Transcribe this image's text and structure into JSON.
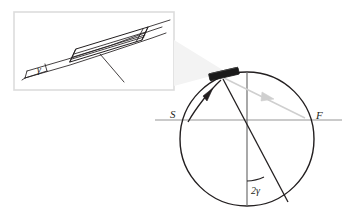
{
  "figure": {
    "background_color": "#ffffff",
    "ink_color": "#231f20",
    "gray_color": "#b9b9b9",
    "light_gray_color": "#cfcfcf",
    "mirror_fill": "#1a1a1a"
  },
  "inset": {
    "name": "mirror-detail-sketch",
    "border_color": "#d8d8d8",
    "x": 14,
    "y": 12,
    "width": 160,
    "height": 78,
    "angle_label": "γ",
    "angle_label_x": 37,
    "angle_label_y": 71,
    "description": "Hand-drawn sketch of a tilted mirror slab with rotation angle gamma measured from the horizontal beam direction"
  },
  "circle_diagram": {
    "name": "rotation-circle",
    "center_x": 247,
    "center_y": 139,
    "radius": 67,
    "stroke_color": "#231f20",
    "stroke_width": 1.3
  },
  "labels": {
    "source": "S",
    "source_x": 173,
    "source_y": 114,
    "focus": "F",
    "focus_x": 318,
    "focus_y": 116,
    "double_angle": "2γ",
    "double_angle_x": 253,
    "double_angle_y": 190,
    "inset_angle": "γ"
  },
  "elements": {
    "mirror": {
      "name": "mirror-bar",
      "center_x": 224,
      "center_y": 74,
      "length": 29,
      "thickness": 6,
      "rotation_deg": -12
    },
    "horizontal_axis": {
      "name": "optical-axis-line",
      "x1": 155,
      "y1": 120,
      "x2": 342,
      "y2": 120,
      "color": "#b9b9b9"
    },
    "vertical_diameter": {
      "name": "vertical-reference-diameter",
      "x1": 247,
      "y1": 72,
      "x2": 247,
      "y2": 206,
      "color": "#6f6f6f"
    },
    "incident_ray": {
      "name": "incident-ray-arrow",
      "from_x": 189,
      "from_y": 121,
      "to_x": 222,
      "to_y": 78,
      "color": "#231f20"
    },
    "reflected_ray": {
      "name": "reflected-ray-arrow",
      "from_x": 224,
      "from_y": 78,
      "to_x": 304,
      "to_y": 118,
      "color": "#cfcfcf"
    },
    "rotated_chord": {
      "name": "rotated-ray-chord",
      "from_x": 223,
      "from_y": 78,
      "to_x": 288,
      "to_y": 203,
      "color": "#231f20"
    },
    "angle_arc": {
      "name": "angle-arc-2gamma",
      "center_x": 247,
      "center_y": 139,
      "radius": 42,
      "color": "#231f20"
    }
  }
}
